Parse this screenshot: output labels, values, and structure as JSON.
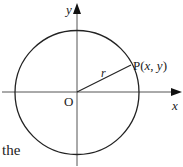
{
  "diagram": {
    "type": "circle-on-axes",
    "axes": {
      "x_label": "x",
      "y_label": "y",
      "origin_label": "O"
    },
    "circle": {
      "center": "O",
      "radius_label": "r"
    },
    "point": {
      "label_prefix": "P(",
      "x": "x",
      "sep": ", ",
      "y": "y",
      "label_suffix": ")"
    },
    "colors": {
      "stroke": "#222222",
      "axis": "#555555"
    }
  },
  "caption": {
    "text": "the"
  }
}
